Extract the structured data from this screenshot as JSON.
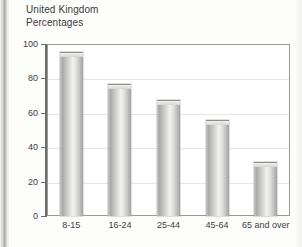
{
  "page": {
    "title_lines": [
      "United Kingdom",
      "Percentages"
    ]
  },
  "chart_data": {
    "type": "bar",
    "title": "United Kingdom",
    "subtitle": "Percentages",
    "categories": [
      "8-15",
      "16-24",
      "25-44",
      "45-64",
      "65 and over"
    ],
    "values": [
      95,
      76,
      67,
      55,
      31
    ],
    "xlabel": "",
    "ylabel": "",
    "ylim": [
      0,
      100
    ],
    "yticks": [
      0,
      20,
      40,
      60,
      80,
      100
    ],
    "ytick_labels": [
      "0",
      "20",
      "40",
      "60",
      "80",
      "100"
    ],
    "grid": true,
    "legend": null,
    "bar_color": "#d2d2d0",
    "frame_color": "#9a9a98"
  }
}
